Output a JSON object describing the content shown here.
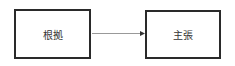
{
  "diagram": {
    "nodes": [
      {
        "id": "evidence",
        "label": "根拠"
      },
      {
        "id": "claim",
        "label": "主張"
      }
    ],
    "edges": [
      {
        "from": "evidence",
        "to": "claim",
        "type": "arrow"
      }
    ],
    "colors": {
      "border": "#2a2a2a",
      "edge": "#999999",
      "text": "#333333"
    }
  }
}
